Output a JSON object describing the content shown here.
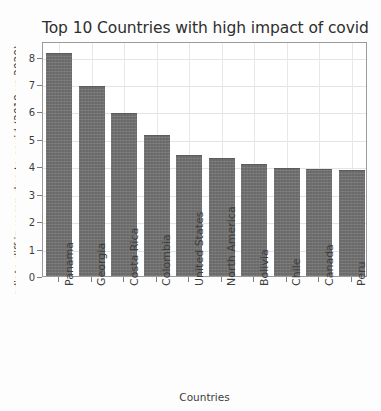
{
  "chart_data": {
    "type": "bar",
    "title": "Top 10 Countries with high impact of covid",
    "xlabel": "Countries",
    "ylabel": "ediate diff in uemp due to covid (2019 vs 2020)",
    "categories": [
      "Panama",
      "Georgia",
      "Costa Rica",
      "Colombia",
      "United States",
      "North America",
      "Bolivia",
      "Chile",
      "Canada",
      "Peru"
    ],
    "values": [
      8.15,
      6.93,
      5.95,
      5.15,
      4.4,
      4.3,
      4.1,
      3.95,
      3.9,
      3.88
    ],
    "yticks": [
      "0",
      "1",
      "2",
      "3",
      "4",
      "5",
      "6",
      "7",
      "8"
    ],
    "ytick_values": [
      0,
      1,
      2,
      3,
      4,
      5,
      6,
      7,
      8
    ],
    "ylim": [
      0,
      8.57
    ],
    "xlim": [
      -0.5,
      9.5
    ],
    "grid": true,
    "legend": "none",
    "bar_color": "#6f6f6f",
    "background_color": "#ffffff",
    "grid_color": "#e4e4e4",
    "axis_color": "#9a9a9a"
  }
}
